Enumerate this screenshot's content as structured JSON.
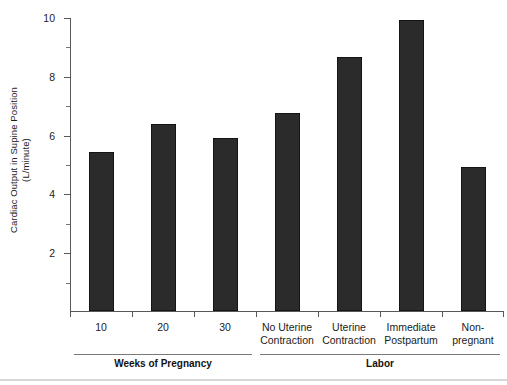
{
  "chart_data": {
    "type": "bar",
    "title": "",
    "xlabel": "",
    "ylabel_line1": "Cardiac Output in Supine Position",
    "ylabel_line2": "(L/minute)",
    "ylim": [
      0,
      10
    ],
    "ytick_labels": [
      "10",
      "8",
      "6",
      "4",
      "2"
    ],
    "ytick_values": [
      10,
      8,
      6,
      4,
      2
    ],
    "yminor_values": [
      9,
      7,
      5,
      3,
      1
    ],
    "grid": false,
    "legend": "none",
    "categories": [
      "10",
      "20",
      "30",
      "No Uterine Contraction",
      "Uterine Contraction",
      "Immediate Postpartum",
      "Non-pregnant"
    ],
    "category_lines": [
      [
        "10"
      ],
      [
        "20"
      ],
      [
        "30"
      ],
      [
        "No Uterine",
        "Contraction"
      ],
      [
        "Uterine",
        "Contraction"
      ],
      [
        "Immediate",
        "Postpartum"
      ],
      [
        "Non-",
        "pregnant"
      ]
    ],
    "values": [
      5.4,
      6.35,
      5.9,
      6.75,
      8.65,
      9.9,
      4.9
    ],
    "bar_color": "#2b2b2b",
    "axis_color": "#585858",
    "groups": [
      {
        "label": "Weeks of Pregnancy",
        "from": 0,
        "to": 2
      },
      {
        "label": "Labor",
        "from": 3,
        "to": 6
      }
    ]
  }
}
